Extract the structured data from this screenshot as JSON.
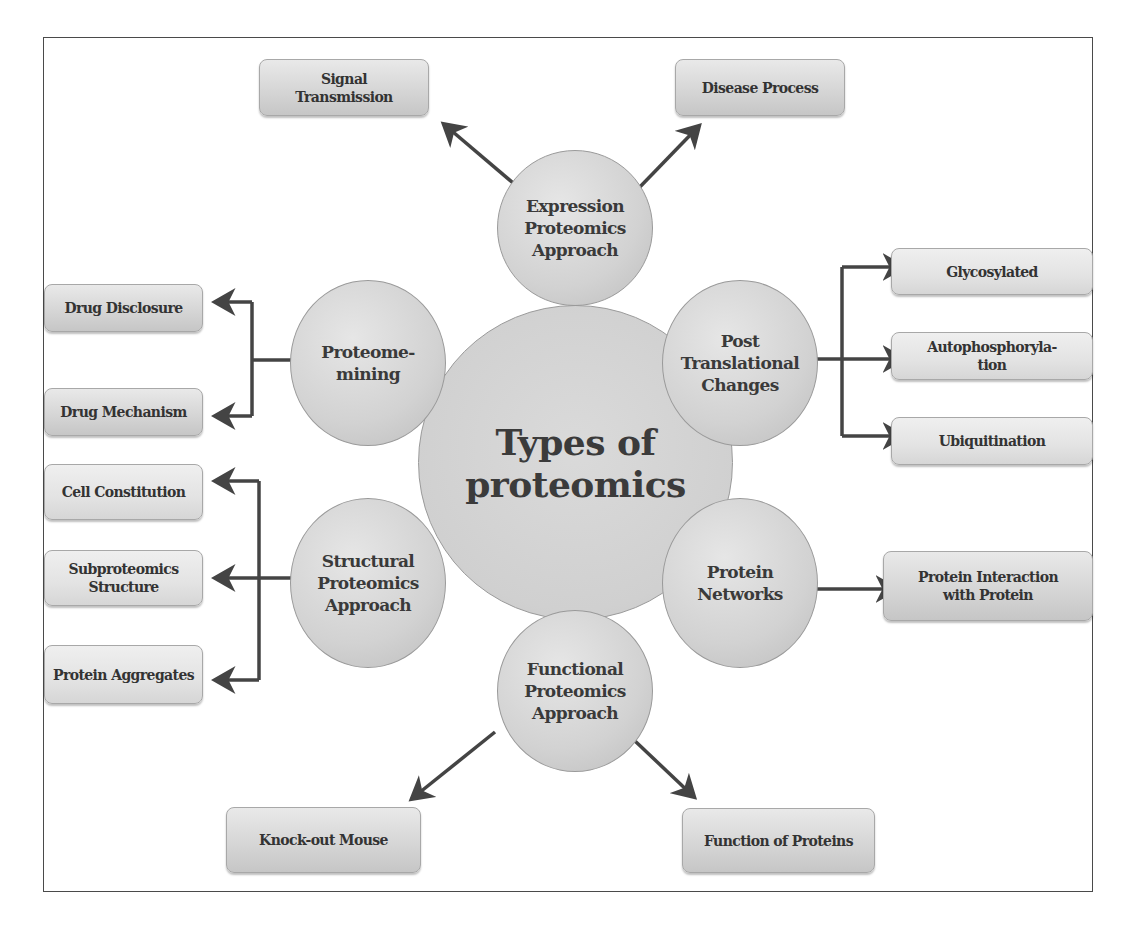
{
  "diagram": {
    "title": "Types of\nproteomics",
    "colors": {
      "frame": "#4a4a4a",
      "circle_fill": "#d2d2d2",
      "box_fill": "#d6d6d6",
      "arrow": "#444444",
      "text": "#3a3a3a"
    },
    "approaches": [
      {
        "id": "expression",
        "label": "Expression\nProteomics\nApproach"
      },
      {
        "id": "proteome-mining",
        "label": "Proteome-\nmining"
      },
      {
        "id": "post-translational",
        "label": "Post\nTranslational\nChanges"
      },
      {
        "id": "structural",
        "label": "Structural\nProteomics\nApproach"
      },
      {
        "id": "protein-networks",
        "label": "Protein\nNetworks"
      },
      {
        "id": "functional",
        "label": "Functional\nProteomics\nApproach"
      }
    ],
    "outcomes": {
      "expression": [
        "Signal\nTransmission",
        "Disease Process"
      ],
      "proteome_mining": [
        "Drug Disclosure",
        "Drug Mechanism"
      ],
      "post_translational": [
        "Glycosylated",
        "Autophosphoryla-\ntion",
        "Ubiquitination"
      ],
      "structural": [
        "Cell Constitution",
        "Subproteomics\nStructure",
        "Protein Aggregates"
      ],
      "protein_networks": [
        "Protein Interaction\nwith Protein"
      ],
      "functional": [
        "Knock-out Mouse",
        "Function of Proteins"
      ]
    },
    "edges": [
      {
        "from": "Expression Proteomics Approach",
        "to": "Signal Transmission"
      },
      {
        "from": "Expression Proteomics Approach",
        "to": "Disease Process"
      },
      {
        "from": "Proteome-mining",
        "to": "Drug Disclosure"
      },
      {
        "from": "Proteome-mining",
        "to": "Drug Mechanism"
      },
      {
        "from": "Post Translational Changes",
        "to": "Glycosylated"
      },
      {
        "from": "Post Translational Changes",
        "to": "Autophosphorylation"
      },
      {
        "from": "Post Translational Changes",
        "to": "Ubiquitination"
      },
      {
        "from": "Structural Proteomics Approach",
        "to": "Cell Constitution"
      },
      {
        "from": "Structural Proteomics Approach",
        "to": "Subproteomics Structure"
      },
      {
        "from": "Structural Proteomics Approach",
        "to": "Protein Aggregates"
      },
      {
        "from": "Protein Networks",
        "to": "Protein Interaction with Protein"
      },
      {
        "from": "Functional Proteomics Approach",
        "to": "Knock-out Mouse"
      },
      {
        "from": "Functional Proteomics Approach",
        "to": "Function of Proteins"
      }
    ]
  }
}
